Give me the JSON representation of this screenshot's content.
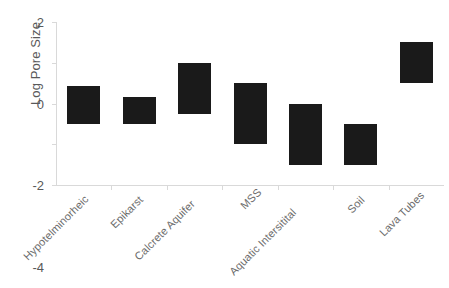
{
  "chart_data": {
    "type": "bar",
    "bar_style": "floating-range",
    "title": "",
    "xlabel": "",
    "ylabel": "Log Pore Size",
    "ylim": [
      -6,
      2
    ],
    "yticks": [
      2,
      0,
      -2,
      -4,
      -6
    ],
    "ytick_labels": [
      "2",
      "0",
      "-2",
      "-4",
      "-6"
    ],
    "grid": false,
    "legend": "none",
    "bar_color": "#1a1a1a",
    "axis_color": "#d9d9d9",
    "text_color": "#595959",
    "categories": [
      "Hypotelminorheic",
      "Epikarst",
      "Calcrete Aquifer",
      "MSS",
      "Aquatic Intersitital",
      "Soil",
      "Lava Tubes"
    ],
    "ranges": [
      {
        "category": "Hypotelminorheic",
        "low": -3.0,
        "high": -1.15
      },
      {
        "category": "Epikarst",
        "low": -3.0,
        "high": -1.7
      },
      {
        "category": "Calcrete Aquifer",
        "low": -2.5,
        "high": 0.0
      },
      {
        "category": "MSS",
        "low": -4.0,
        "high": -1.0
      },
      {
        "category": "Aquatic Intersitital",
        "low": -5.0,
        "high": -2.0
      },
      {
        "category": "Soil",
        "low": -5.0,
        "high": -3.0
      },
      {
        "category": "Lava Tubes",
        "low": -1.0,
        "high": 1.0
      }
    ]
  }
}
